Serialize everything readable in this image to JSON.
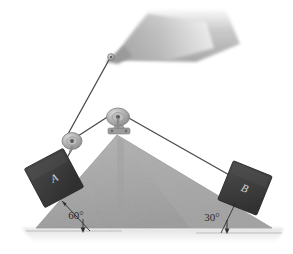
{
  "figure": {
    "background_color": "#ffffff",
    "width": 293,
    "height": 254
  },
  "wedge": {
    "name": "double-incline-wedge",
    "fill_color": "#a8a8a8",
    "edge_color": "#8f8f8f",
    "apex_x": 117,
    "apex_y": 135,
    "left_base_x": 36,
    "right_base_x": 272,
    "base_y": 228
  },
  "ground": {
    "name": "ground-shadow",
    "color": "#e2e2e2",
    "baseline_color": "#b5b5b5"
  },
  "overhang": {
    "name": "ceiling-overhang",
    "fill_color": "#b9b9b9",
    "anchor_x": 110,
    "anchor_y": 57
  },
  "blocks": [
    {
      "id": "block-a",
      "label": "A",
      "fill_color": "#3c3c3c",
      "edge_color": "#2a2a2a",
      "center_x": 54,
      "center_y": 178,
      "size": 44,
      "rotation_deg": -28
    },
    {
      "id": "block-b",
      "label": "B",
      "fill_color": "#3c3c3c",
      "edge_color": "#2a2a2a",
      "center_x": 245,
      "center_y": 188,
      "size": 42,
      "rotation_deg": 22
    }
  ],
  "pulleys": [
    {
      "id": "upper-pulley",
      "center_x": 118,
      "center_y": 117,
      "radius": 9,
      "body_color": "#b0b0b0",
      "hub_color": "#6e6e6e"
    },
    {
      "id": "lower-pulley",
      "center_x": 72,
      "center_y": 141,
      "radius": 8,
      "body_color": "#b0b0b0",
      "hub_color": "#6e6e6e"
    }
  ],
  "cords": {
    "color": "#4a4a4a",
    "width": 1.3,
    "segments": [
      {
        "id": "cord-anchor-to-lower-pulley",
        "x1": 110,
        "y1": 58,
        "x2": 68,
        "y2": 134
      },
      {
        "id": "cord-lower-pulley-to-upper-pulley",
        "x1": 78,
        "y1": 136,
        "x2": 112,
        "y2": 114
      },
      {
        "id": "cord-lower-pulley-to-block-a",
        "x1": 72,
        "y1": 149,
        "x2": 64,
        "y2": 163
      },
      {
        "id": "cord-upper-pulley-to-block-b",
        "x1": 127,
        "y1": 117,
        "x2": 229,
        "y2": 175
      }
    ]
  },
  "angles": [
    {
      "id": "angle-left",
      "label": "60°",
      "label_x": 76,
      "label_y": 219,
      "tick_x1": 62,
      "tick_y1": 202,
      "tick_x2": 88,
      "tick_y2": 230,
      "arrow_x": 83,
      "arrow_y1": 221,
      "arrow_y2": 231
    },
    {
      "id": "angle-right",
      "label": "30°",
      "label_x": 212,
      "label_y": 221,
      "tick_x1": 234,
      "tick_y1": 203,
      "tick_x2": 222,
      "tick_y2": 232,
      "arrow_x": 227,
      "arrow_y1": 222,
      "arrow_y2": 232
    }
  ]
}
